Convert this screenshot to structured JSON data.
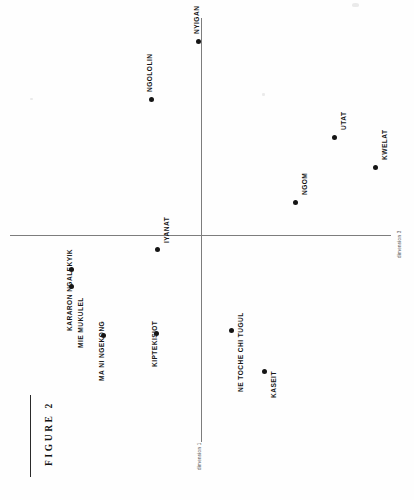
{
  "figure": {
    "caption": "FIGURE 2"
  },
  "chart_data": {
    "type": "scatter",
    "title": "FIGURE 2",
    "xlabel": "dimension 3",
    "ylabel": "dimension 1",
    "grid": false,
    "legend": "none",
    "axes": {
      "horizontal_axis_label": "dimension 3",
      "vertical_axis_label": "dimension 1",
      "origin_px": [
        201,
        235
      ],
      "xlim": [
        -1.0,
        1.0
      ],
      "ylim": [
        -1.0,
        1.0
      ]
    },
    "points": [
      {
        "label": "NYIGAN",
        "x": -0.02,
        "y": 0.91,
        "px": 198,
        "py": 41
      },
      {
        "label": "NGOLOLIN",
        "x": -0.27,
        "y": 0.66,
        "px": 151,
        "py": 99
      },
      {
        "label": "UTAT",
        "x": 0.71,
        "y": 0.46,
        "px": 334,
        "py": 137
      },
      {
        "label": "KWELAT",
        "x": 0.93,
        "y": 0.32,
        "px": 375,
        "py": 167
      },
      {
        "label": "NGOM",
        "x": 0.5,
        "y": 0.15,
        "px": 295,
        "py": 202
      },
      {
        "label": "IYANAT",
        "x": -0.24,
        "y": -0.07,
        "px": 157,
        "py": 249
      },
      {
        "label": "KARARON NGALEKYIK",
        "x": -0.69,
        "y": -0.16,
        "px": 71,
        "py": 269
      },
      {
        "label": "MIE MUKULEL",
        "x": -0.69,
        "y": -0.24,
        "px": 71,
        "py": 286
      },
      {
        "label": "NE TOCHE CHI TUGUL",
        "x": 0.16,
        "y": -0.45,
        "px": 231,
        "py": 330
      },
      {
        "label": "KIPTEKISIOT",
        "x": -0.24,
        "y": -0.46,
        "px": 156,
        "py": 333
      },
      {
        "label": "MA NI NGEKONG",
        "x": -0.52,
        "y": -0.47,
        "px": 103,
        "py": 335
      },
      {
        "label": "KASEIT",
        "x": 0.33,
        "y": -0.67,
        "px": 264,
        "py": 371
      }
    ],
    "label_offsets": [
      {
        "label": "NYIGAN",
        "lx": 193,
        "ly": 34
      },
      {
        "label": "NGOLOLIN",
        "lx": 146,
        "ly": 92
      },
      {
        "label": "UTAT",
        "lx": 340,
        "ly": 130
      },
      {
        "label": "KWELAT",
        "lx": 381,
        "ly": 160
      },
      {
        "label": "NGOM",
        "lx": 301,
        "ly": 195
      },
      {
        "label": "IYANAT",
        "lx": 163,
        "ly": 243
      },
      {
        "label": "KARARON NGALEKYIK",
        "lx": 66,
        "ly": 331
      },
      {
        "label": "MIE MUKULEL",
        "lx": 77,
        "ly": 348
      },
      {
        "label": "NE TOCHE CHI TUGUL",
        "lx": 237,
        "ly": 392
      },
      {
        "label": "KIPTEKISIOT",
        "lx": 151,
        "ly": 367
      },
      {
        "label": "MA NI NGEKONG",
        "lx": 98,
        "ly": 381
      },
      {
        "label": "KASEIT",
        "lx": 270,
        "ly": 398
      }
    ]
  },
  "colors": {
    "point": "#151515",
    "axis": "#7d7d7d",
    "label": "#171717",
    "axis_label": "#4a4a4a",
    "background": "#fefefe"
  }
}
